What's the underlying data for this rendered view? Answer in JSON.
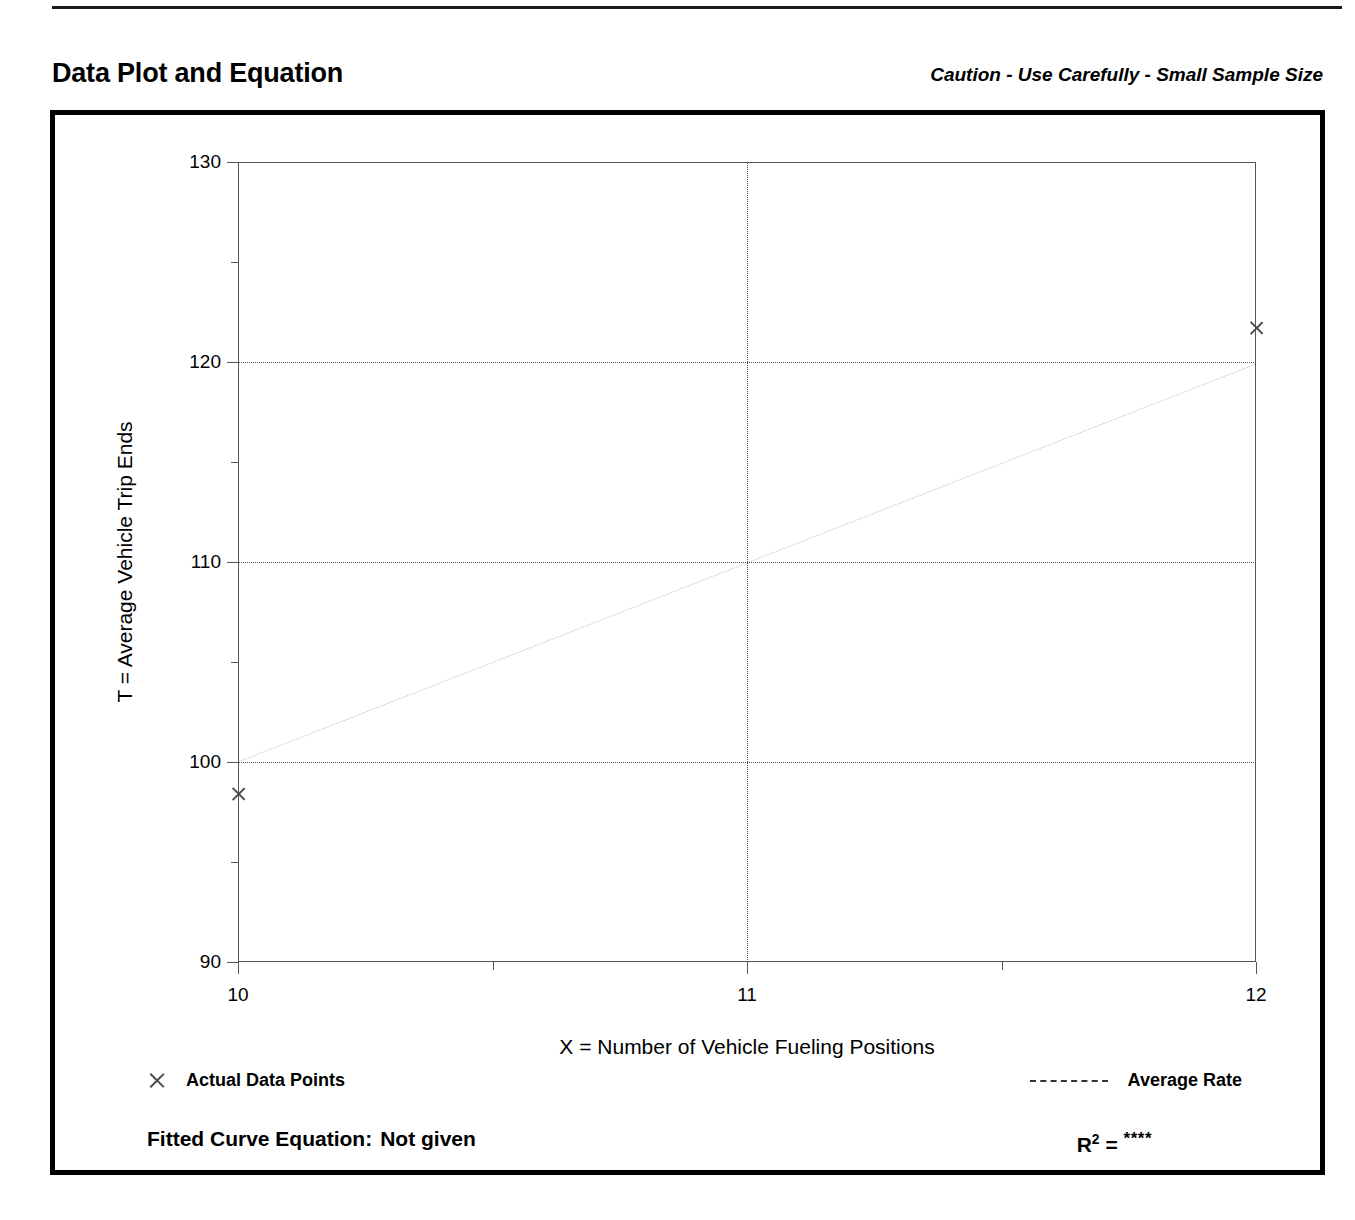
{
  "header": {
    "title": "Data Plot and Equation",
    "caution": "Caution - Use Carefully - Small Sample Size"
  },
  "legend": {
    "data_points_label": "Actual Data Points",
    "average_rate_label": "Average Rate",
    "marker_icon": "x-marker-icon",
    "line_icon": "dashed-line-icon"
  },
  "footer": {
    "equation_label": "Fitted Curve Equation:",
    "equation_value": "Not given",
    "r2_label": "R",
    "r2_exponent": "2",
    "r2_equals": "=",
    "r2_value": "****"
  },
  "colors": {
    "ink": "#000000",
    "grid": "#555555",
    "marker": "#4a4a4a",
    "fit_line": "#333333"
  },
  "chart_data": {
    "type": "scatter",
    "title": "Data Plot and Equation",
    "subtitle": "Caution - Use Carefully - Small Sample Size",
    "xlabel": "X = Number of Vehicle Fueling Positions",
    "ylabel": "T = Average Vehicle Trip Ends",
    "xlim": [
      10,
      12
    ],
    "ylim": [
      90,
      130
    ],
    "xticks": [
      10,
      11,
      12
    ],
    "xtick_labels": [
      "10",
      "11",
      "12"
    ],
    "x_minor_ticks": [
      10.5,
      11.5
    ],
    "yticks": [
      90,
      100,
      110,
      120,
      130
    ],
    "ytick_labels": [
      "90",
      "100",
      "110",
      "120",
      "130"
    ],
    "y_minor_ticks": [
      95,
      105,
      115,
      125
    ],
    "grid": "dotted gridlines at y = 100, 110, 120 and x = 11",
    "legend_position": "below-axis",
    "series": [
      {
        "name": "Actual Data Points",
        "type": "scatter",
        "marker": "x",
        "points": [
          {
            "x": 10,
            "y": 98.4
          },
          {
            "x": 12,
            "y": 121.7
          }
        ]
      },
      {
        "name": "Average Rate",
        "type": "line",
        "style": "dashed",
        "points": [
          {
            "x": 10,
            "y": 100.0
          },
          {
            "x": 12,
            "y": 119.9
          }
        ]
      }
    ],
    "fitted_curve_equation": "Not given",
    "r_squared": "****"
  }
}
